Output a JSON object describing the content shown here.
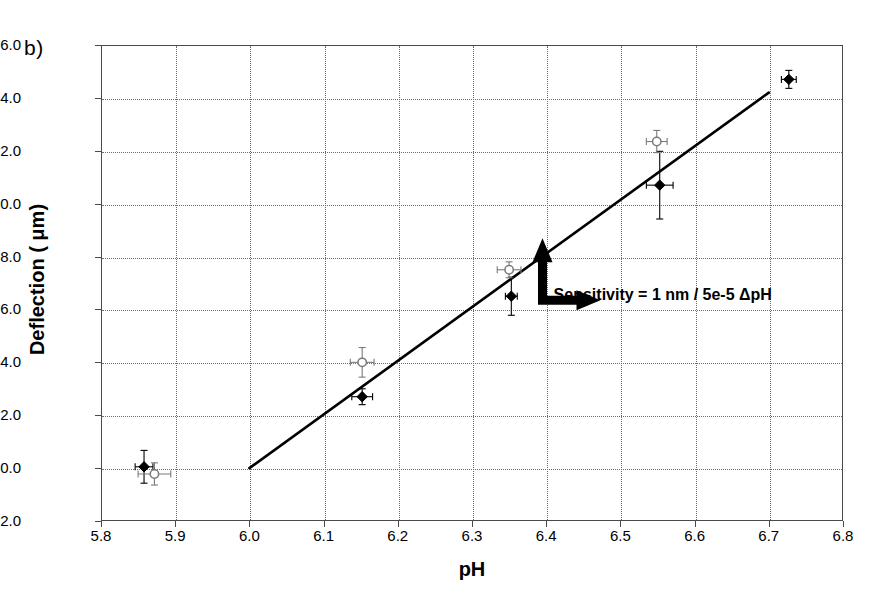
{
  "panel": {
    "label": "b)"
  },
  "chart_data": {
    "type": "scatter",
    "title": "",
    "xlabel": "pH",
    "ylabel": "Deflection ( μm)",
    "xlim": [
      5.8,
      6.8
    ],
    "ylim": [
      -2.0,
      16.0
    ],
    "xticks": [
      "5.8",
      "5.9",
      "6.0",
      "6.1",
      "6.2",
      "6.3",
      "6.4",
      "6.5",
      "6.6",
      "6.7",
      "6.8"
    ],
    "yticks": [
      "16.0",
      "14.0",
      "12.0",
      "10.0",
      "8.0",
      "6.0",
      "4.0",
      "2.0",
      "0.0",
      "-2.0"
    ],
    "xtick_values": [
      5.8,
      5.9,
      6.0,
      6.1,
      6.2,
      6.3,
      6.4,
      6.5,
      6.6,
      6.7,
      6.8
    ],
    "ytick_values": [
      16.0,
      14.0,
      12.0,
      10.0,
      8.0,
      6.0,
      4.0,
      2.0,
      0.0,
      -2.0
    ],
    "grid": true,
    "legend": "none",
    "series": [
      {
        "name": "filled",
        "marker": "filled-diamond",
        "color": "#000000",
        "points": [
          {
            "x": 5.858,
            "y": 0.05,
            "xerr": 0.012,
            "yerr": 0.62
          },
          {
            "x": 6.152,
            "y": 2.7,
            "xerr": 0.014,
            "yerr": 0.3
          },
          {
            "x": 6.353,
            "y": 6.5,
            "xerr": 0.008,
            "yerr": 0.72
          },
          {
            "x": 6.553,
            "y": 10.7,
            "xerr": 0.018,
            "yerr": 1.28
          },
          {
            "x": 6.727,
            "y": 14.7,
            "xerr": 0.01,
            "yerr": 0.34
          }
        ]
      },
      {
        "name": "open",
        "marker": "open-circle",
        "color": "#7a7a7a",
        "points": [
          {
            "x": 5.872,
            "y": -0.22,
            "xerr": 0.022,
            "yerr": 0.42
          },
          {
            "x": 6.152,
            "y": 4.0,
            "xerr": 0.016,
            "yerr": 0.56
          },
          {
            "x": 6.35,
            "y": 7.5,
            "xerr": 0.016,
            "yerr": 0.3
          },
          {
            "x": 6.549,
            "y": 12.35,
            "xerr": 0.014,
            "yerr": 0.42
          }
        ]
      }
    ],
    "fit_line": {
      "x0": 6.0,
      "y0": 0.0,
      "x1": 6.7,
      "y1": 14.2,
      "color": "#000000",
      "width": 2.6
    },
    "annotations": [
      {
        "name": "sensitivity",
        "text": "Sensitivity = 1 nm / 5e-5 ΔpH",
        "x": 6.41,
        "y": 6.55
      }
    ]
  }
}
